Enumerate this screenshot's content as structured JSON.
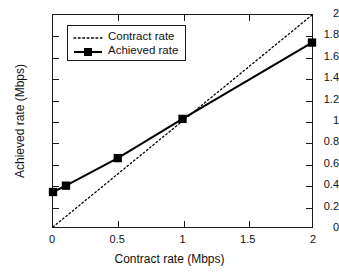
{
  "chart_data": {
    "type": "line",
    "title": "",
    "xlabel": "Contract rate (Mbps)",
    "ylabel": "Achieved rate (Mbps)",
    "xlim": [
      0,
      2
    ],
    "ylim": [
      0,
      2
    ],
    "grid": false,
    "legend_position": "upper-left",
    "xticks": [
      {
        "value": 0,
        "label": "0"
      },
      {
        "value": 0.5,
        "label": "0.5"
      },
      {
        "value": 1,
        "label": "1"
      },
      {
        "value": 1.5,
        "label": "1.5"
      },
      {
        "value": 2,
        "label": "2"
      }
    ],
    "yticks": [
      {
        "value": 0,
        "label": "0"
      },
      {
        "value": 0.2,
        "label": "0.2"
      },
      {
        "value": 0.4,
        "label": "0.4"
      },
      {
        "value": 0.6,
        "label": "0.6"
      },
      {
        "value": 0.8,
        "label": "0.8"
      },
      {
        "value": 1,
        "label": "1"
      },
      {
        "value": 1.2,
        "label": "1.2"
      },
      {
        "value": 1.4,
        "label": "1.4"
      },
      {
        "value": 1.6,
        "label": "1.6"
      },
      {
        "value": 1.8,
        "label": "1.8"
      },
      {
        "value": 2,
        "label": "2"
      }
    ],
    "series": [
      {
        "name": "Contract rate",
        "style": "dotted",
        "marker": "none",
        "color": "#000000",
        "x": [
          0,
          2
        ],
        "y": [
          0,
          2
        ]
      },
      {
        "name": "Achieved rate",
        "style": "solid",
        "marker": "square",
        "color": "#000000",
        "x": [
          0,
          0.1,
          0.5,
          1,
          2
        ],
        "y": [
          0.33,
          0.39,
          0.65,
          1.02,
          1.74
        ]
      }
    ]
  },
  "legend": {
    "entries": [
      {
        "label": "Contract rate"
      },
      {
        "label": "Achieved rate"
      }
    ]
  }
}
